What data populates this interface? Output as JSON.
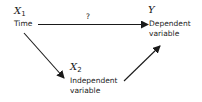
{
  "diagram": {
    "nodes": {
      "x1": {
        "symbol": "X",
        "subscript": "1",
        "label_line1": "Time",
        "label_line2": ""
      },
      "y": {
        "symbol": "Y",
        "subscript": "",
        "label_line1": "Dependent",
        "label_line2": "variable"
      },
      "x2": {
        "symbol": "X",
        "subscript": "2",
        "label_line1": "Independent",
        "label_line2": "variable"
      }
    },
    "edges": [
      {
        "from": "x1",
        "to": "y",
        "label": "?"
      },
      {
        "from": "x1",
        "to": "x2",
        "label": ""
      },
      {
        "from": "x2",
        "to": "y",
        "label": ""
      }
    ],
    "colors": {
      "ink": "#1a1a1a",
      "background": "#ffffff"
    }
  }
}
